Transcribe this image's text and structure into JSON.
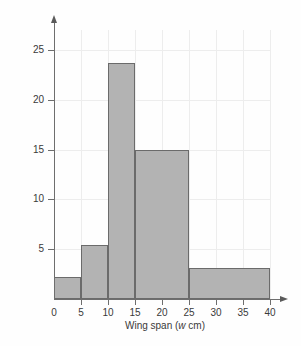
{
  "chart_data": {
    "type": "bar",
    "title": "",
    "subtitle": "",
    "xlabel": "Wing span (w cm)",
    "xlabel_prefix": "Wing span (",
    "xlabel_variable": "w",
    "xlabel_suffix": " cm)",
    "ylabel": "Frequency density",
    "xlim": [
      0,
      40
    ],
    "ylim": [
      0,
      27
    ],
    "grid": true,
    "legend": "none",
    "x_ticks": [
      0,
      5,
      10,
      15,
      20,
      25,
      30,
      35,
      40
    ],
    "x_ticklabels": [
      "0",
      "5",
      "10",
      "15",
      "20",
      "25",
      "30",
      "35",
      "40"
    ],
    "y_ticks": [
      5,
      10,
      15,
      20,
      25
    ],
    "y_ticklabels": [
      "5",
      "10",
      "15",
      "20",
      "25"
    ],
    "bars": [
      {
        "label": "0-5",
        "x_start": 0,
        "x_end": 5,
        "value": 2.2
      },
      {
        "label": "5-10",
        "x_start": 5,
        "x_end": 10,
        "value": 5.4
      },
      {
        "label": "10-15",
        "x_start": 10,
        "x_end": 15,
        "value": 23.7
      },
      {
        "label": "15-25",
        "x_start": 15,
        "x_end": 25,
        "value": 15.0
      },
      {
        "label": "25-40",
        "x_start": 25,
        "x_end": 40,
        "value": 3.1
      }
    ],
    "categories": [
      "0-5",
      "5-10",
      "10-15",
      "15-25",
      "25-40"
    ],
    "values": [
      2.2,
      5.4,
      23.7,
      15.0,
      3.1
    ],
    "colors": {
      "bar_fill": "#b3b3b3",
      "bar_edge": "#6b6b6b",
      "axis": "#6e6e6e",
      "grid": "#ededed",
      "text": "#3a3a3a",
      "background": "#fefefe"
    }
  }
}
